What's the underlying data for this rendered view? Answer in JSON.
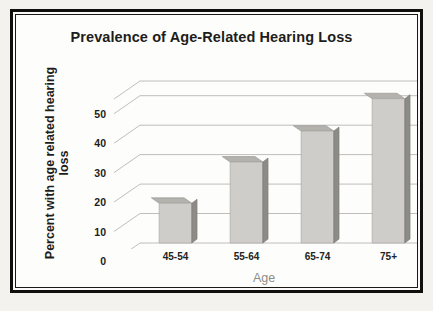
{
  "chart_data": {
    "type": "bar",
    "title": "Prevalence of Age-Related Hearing Loss",
    "xlabel": "Age",
    "ylabel_line1": "Percent with age related hearing",
    "ylabel_line2": "loss",
    "ylabel": "Percent with age related hearing loss",
    "categories": [
      "45-54",
      "55-64",
      "65-74",
      "75+"
    ],
    "values": [
      13.5,
      27.5,
      38,
      49
    ],
    "ylim": [
      0,
      55
    ],
    "yticks": [
      0,
      10,
      20,
      30,
      40,
      50
    ],
    "ytick_labels": [
      "0",
      "10",
      "20",
      "30",
      "40",
      "50"
    ],
    "grid": true,
    "legend": "none",
    "style": "3d-column",
    "colors": {
      "bar_front": "#cfcdc9",
      "bar_top": "#b4b2ad",
      "bar_side": "#8d8b87",
      "gridline": "#b9b7b3",
      "title_text": "#1d1d1b",
      "axis_text": "#1d1d1b",
      "xlabel_text": "#8d8d8b",
      "plot_background": "#fdfdfb",
      "frame_border": "#100f0d",
      "page_background": "#f3f2ef"
    }
  }
}
